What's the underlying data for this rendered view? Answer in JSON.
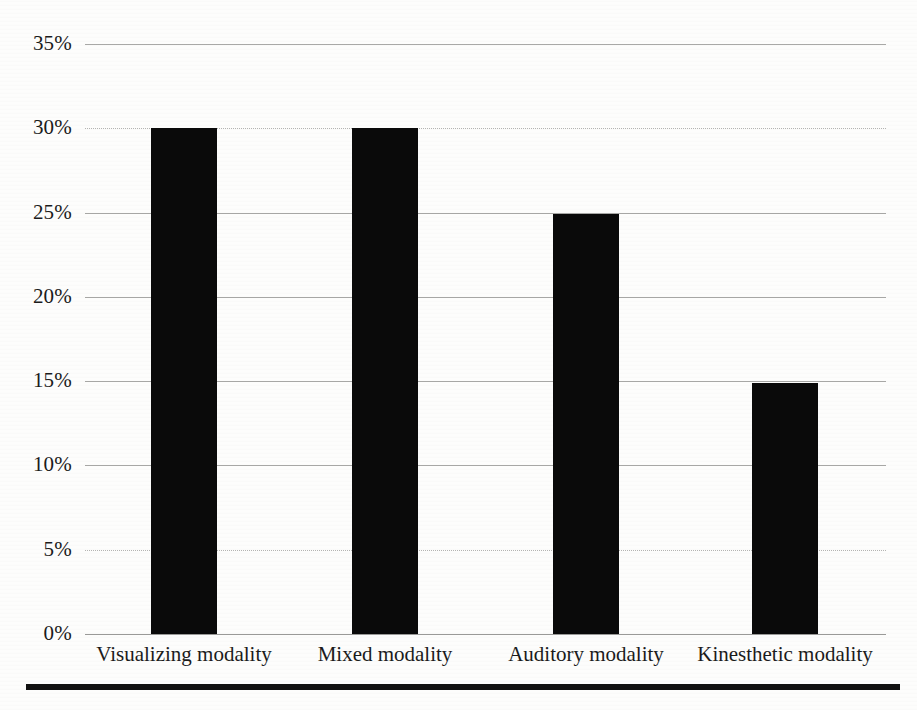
{
  "chart_data": {
    "type": "bar",
    "title": "",
    "xlabel": "",
    "ylabel": "",
    "categories": [
      "Visualizing modality",
      "Mixed modality",
      "Auditory modality",
      "Kinesthetic modality"
    ],
    "values": [
      30,
      30,
      24.9,
      14.9
    ],
    "value_labels": [
      "30%",
      "30%",
      "25%",
      "15%"
    ],
    "ylim": [
      0,
      35
    ],
    "ytick_values": [
      0,
      5,
      10,
      15,
      20,
      25,
      30,
      35
    ],
    "ytick_labels": [
      "0%",
      "5%",
      "10%",
      "15%",
      "20%",
      "25%",
      "30%",
      "35%"
    ],
    "grid": true,
    "legend": "none",
    "series": [
      {
        "name": "Percentage of learners",
        "values": [
          30,
          30,
          24.9,
          14.9
        ]
      }
    ],
    "colors": {
      "bar": "#0a0a0a",
      "gridline": "#a9a9a7",
      "axis_text": "#1b1b1b",
      "background": "#fdfdfc",
      "footer_rule": "#111111"
    }
  }
}
